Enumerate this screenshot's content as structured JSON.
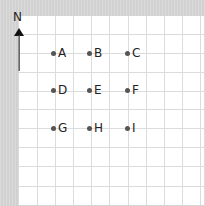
{
  "compass": {
    "label": "N",
    "icon": "north-arrow-icon"
  },
  "grid": {
    "vertical_lines_x": [
      18,
      36,
      54,
      72,
      90,
      109,
      127,
      145,
      163,
      181
    ],
    "horizontal_lines_y": [
      18,
      37,
      56,
      75,
      93,
      112,
      131,
      150,
      170
    ]
  },
  "points": [
    {
      "label": "A",
      "x": 54,
      "y": 53
    },
    {
      "label": "B",
      "x": 90,
      "y": 53
    },
    {
      "label": "C",
      "x": 128,
      "y": 53
    },
    {
      "label": "D",
      "x": 54,
      "y": 90
    },
    {
      "label": "E",
      "x": 90,
      "y": 90
    },
    {
      "label": "F",
      "x": 128,
      "y": 90
    },
    {
      "label": "G",
      "x": 54,
      "y": 128
    },
    {
      "label": "H",
      "x": 90,
      "y": 128
    },
    {
      "label": "I",
      "x": 128,
      "y": 128
    }
  ],
  "colors": {
    "background": "#d8d8d8",
    "panel": "#ffffff",
    "gridline": "#dcdcdc",
    "dot": "#555555",
    "text": "#222222"
  }
}
